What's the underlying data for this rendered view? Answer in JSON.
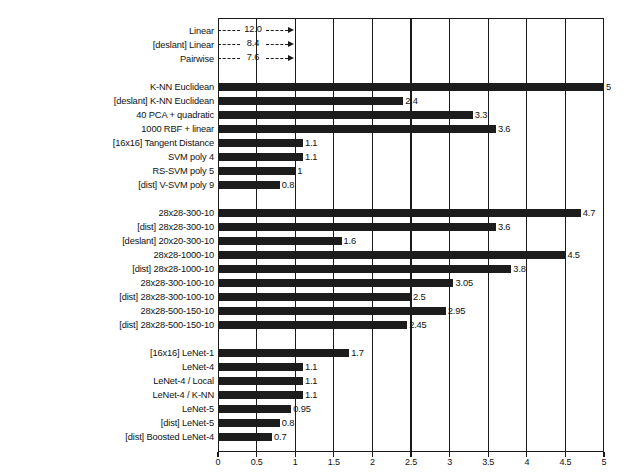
{
  "chart_data": {
    "type": "bar",
    "orientation": "horizontal",
    "title": "",
    "xlabel": "",
    "ylabel": "",
    "xlim": [
      0,
      5
    ],
    "grid": true,
    "legend": "none",
    "xticks": [
      "0",
      "0.5",
      "1",
      "1.5",
      "2",
      "2.5",
      "3",
      "3.5",
      "4",
      "4.5",
      "5"
    ],
    "xtick_values": [
      0,
      0.5,
      1,
      1.5,
      2,
      2.5,
      3,
      3.5,
      4,
      4.5,
      5
    ],
    "groups": [
      {
        "name": "linear-classifiers",
        "rows": [
          {
            "label": "Linear",
            "value": 12.0,
            "value_label": "12.0",
            "offscale": true
          },
          {
            "label": "[deslant] Linear",
            "value": 8.4,
            "value_label": "8.4",
            "offscale": true
          },
          {
            "label": "Pairwise",
            "value": 7.6,
            "value_label": "7.6",
            "offscale": true
          }
        ]
      },
      {
        "name": "knn-svm-kernel",
        "rows": [
          {
            "label": "K-NN Euclidean",
            "value": 5.0,
            "value_label": "5",
            "offscale": false
          },
          {
            "label": "[deslant] K-NN Euclidean",
            "value": 2.4,
            "value_label": "2.4",
            "offscale": false
          },
          {
            "label": "40 PCA + quadratic",
            "value": 3.3,
            "value_label": "3.3",
            "offscale": false
          },
          {
            "label": "1000 RBF + linear",
            "value": 3.6,
            "value_label": "3.6",
            "offscale": false
          },
          {
            "label": "[16x16] Tangent Distance",
            "value": 1.1,
            "value_label": "1.1",
            "offscale": false
          },
          {
            "label": "SVM poly 4",
            "value": 1.1,
            "value_label": "1.1",
            "offscale": false
          },
          {
            "label": "RS-SVM poly 5",
            "value": 1.0,
            "value_label": "1",
            "offscale": false
          },
          {
            "label": "[dist] V-SVM poly 9",
            "value": 0.8,
            "value_label": "0.8",
            "offscale": false
          }
        ]
      },
      {
        "name": "fully-connected-nets",
        "rows": [
          {
            "label": "28x28-300-10",
            "value": 4.7,
            "value_label": "4.7",
            "offscale": false
          },
          {
            "label": "[dist] 28x28-300-10",
            "value": 3.6,
            "value_label": "3.6",
            "offscale": false
          },
          {
            "label": "[deslant] 20x20-300-10",
            "value": 1.6,
            "value_label": "1.6",
            "offscale": false
          },
          {
            "label": "28x28-1000-10",
            "value": 4.5,
            "value_label": "4.5",
            "offscale": false
          },
          {
            "label": "[dist] 28x28-1000-10",
            "value": 3.8,
            "value_label": "3.8",
            "offscale": false
          },
          {
            "label": "28x28-300-100-10",
            "value": 3.05,
            "value_label": "3.05",
            "offscale": false
          },
          {
            "label": "[dist] 28x28-300-100-10",
            "value": 2.5,
            "value_label": "2.5",
            "offscale": false
          },
          {
            "label": "28x28-500-150-10",
            "value": 2.95,
            "value_label": "2.95",
            "offscale": false
          },
          {
            "label": "[dist] 28x28-500-150-10",
            "value": 2.45,
            "value_label": "2.45",
            "offscale": false
          }
        ]
      },
      {
        "name": "convolutional-nets",
        "rows": [
          {
            "label": "[16x16] LeNet-1",
            "value": 1.7,
            "value_label": "1.7",
            "offscale": false
          },
          {
            "label": "LeNet-4",
            "value": 1.1,
            "value_label": "1.1",
            "offscale": false
          },
          {
            "label": "LeNet-4 / Local",
            "value": 1.1,
            "value_label": "1.1",
            "offscale": false
          },
          {
            "label": "LeNet-4 / K-NN",
            "value": 1.1,
            "value_label": "1.1",
            "offscale": false
          },
          {
            "label": "LeNet-5",
            "value": 0.95,
            "value_label": "0.95",
            "offscale": false
          },
          {
            "label": "[dist] LeNet-5",
            "value": 0.8,
            "value_label": "0.8",
            "offscale": false
          },
          {
            "label": "[dist] Boosted LeNet-4",
            "value": 0.7,
            "value_label": "0.7",
            "offscale": false
          }
        ]
      }
    ],
    "colors": {
      "bar": "#1c1c1c",
      "axis": "#1a1a1a",
      "background": "#ffffff",
      "text": "#111111"
    }
  }
}
